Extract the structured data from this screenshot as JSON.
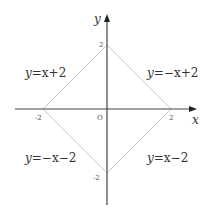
{
  "diagram": {
    "type": "coordinate-plot",
    "axes": {
      "x_label": "x",
      "y_label": "y",
      "origin_label": "O",
      "x_ticks": [
        {
          "value": -2,
          "label": "-2"
        },
        {
          "value": 2,
          "label": "2"
        }
      ],
      "y_ticks": [
        {
          "value": 2,
          "label": "2"
        },
        {
          "value": -2,
          "label": "-2"
        }
      ]
    },
    "shape": {
      "name": "square",
      "vertices": [
        [
          2,
          0
        ],
        [
          0,
          2
        ],
        [
          -2,
          0
        ],
        [
          0,
          -2
        ]
      ]
    },
    "equations": [
      {
        "id": "upper-left",
        "label_prefix": "y",
        "label_rest": "=x+2",
        "full": "y=x+2"
      },
      {
        "id": "upper-right",
        "label_prefix": "y",
        "label_rest": "=−x+2",
        "full": "y=-x+2"
      },
      {
        "id": "lower-left",
        "label_prefix": "y",
        "label_rest": "=−x−2",
        "full": "y=-x-2"
      },
      {
        "id": "lower-right",
        "label_prefix": "y",
        "label_rest": "=x−2",
        "full": "y=x-2"
      }
    ],
    "colors": {
      "axis": "#444444",
      "lines": "#c8c8c8",
      "text": "#333333"
    }
  }
}
